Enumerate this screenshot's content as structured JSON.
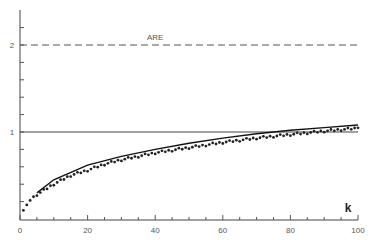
{
  "chart_data": {
    "type": "line",
    "title": "",
    "xlabel": "k",
    "ylabel": "",
    "xlim": [
      0,
      100
    ],
    "ylim": [
      0,
      2.2
    ],
    "x_ticks": [
      0,
      20,
      40,
      60,
      80,
      100
    ],
    "y_tick_labels": [
      {
        "value": 1,
        "label": "1"
      },
      {
        "value": 2,
        "label": "2"
      }
    ],
    "grid": false,
    "annotations": [
      {
        "text": "ARE",
        "x": 40,
        "y": 2.05
      }
    ],
    "series": [
      {
        "name": "ARE",
        "style": "dashed",
        "x": [
          0,
          100
        ],
        "y": [
          2,
          2
        ]
      },
      {
        "name": "reference",
        "style": "solid-thin",
        "x": [
          0,
          100
        ],
        "y": [
          1,
          1
        ]
      },
      {
        "name": "theoretical",
        "style": "solid",
        "x": [
          5,
          10,
          20,
          30,
          40,
          50,
          60,
          70,
          80,
          90,
          100
        ],
        "y": [
          0.3,
          0.45,
          0.62,
          0.72,
          0.8,
          0.87,
          0.93,
          0.98,
          1.02,
          1.05,
          1.08
        ]
      },
      {
        "name": "simulated",
        "style": "dots",
        "x": [
          1,
          2,
          3,
          5,
          10,
          15,
          20,
          25,
          30,
          40,
          50,
          60,
          70,
          80,
          90,
          99,
          100
        ],
        "y": [
          0.1,
          0.15,
          0.22,
          0.28,
          0.4,
          0.5,
          0.56,
          0.63,
          0.68,
          0.76,
          0.82,
          0.88,
          0.93,
          0.97,
          1.01,
          1.04,
          1.06
        ]
      }
    ]
  }
}
